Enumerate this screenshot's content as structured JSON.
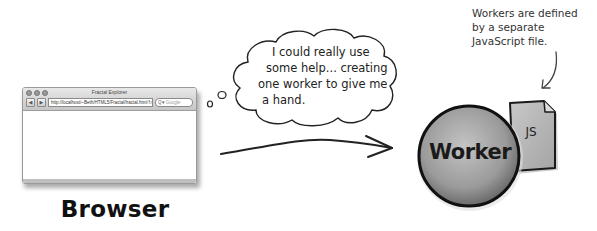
{
  "browser": {
    "window_title": "Fractal Explorer",
    "url": "http://localhost/~Beth/HTML5/Fractal/fractal.html",
    "search_placeholder": "Google",
    "back_glyph": "◀",
    "forward_glyph": "▶",
    "reload_glyph": "↻",
    "search_glyph": "Q▾",
    "label": "Browser"
  },
  "thought_bubble": {
    "lines": [
      "I could really use",
      "some help... creating",
      "one worker to give me",
      "a hand."
    ]
  },
  "worker": {
    "label": "Worker",
    "file_label": "JS"
  },
  "annotation": {
    "lines": [
      "Workers are defined",
      "by a separate",
      "JavaScript file."
    ]
  },
  "colors": {
    "ink": "#1a1a1a",
    "worker_fill": "#9a9a9a",
    "file_fill": "#b5b5b5"
  }
}
